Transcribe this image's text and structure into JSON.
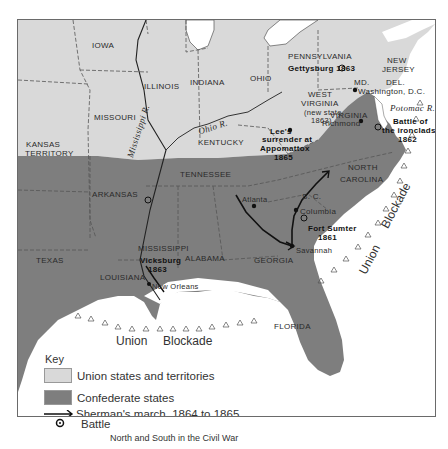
{
  "map": {
    "colors": {
      "union": "#d9d9d9",
      "confederate": "#7e7e7e",
      "water": "#ffffff",
      "border": "#555555",
      "route": "#111111"
    },
    "union_states": [
      "IOWA",
      "ILLINOIS",
      "INDIANA",
      "OHIO",
      "PENNSYLVANIA",
      "NEW JERSEY",
      "MISSOURI",
      "KANSAS TERRITORY",
      "KENTUCKY",
      "WEST VIRGINIA",
      "MD.",
      "DEL."
    ],
    "confederate_states": [
      "TEXAS",
      "ARKANSAS",
      "LOUISIANA",
      "MISSISSIPPI",
      "ALABAMA",
      "TENNESSEE",
      "GEORGIA",
      "FLORIDA",
      "VIRGINIA",
      "NORTH CAROLINA",
      "S. C."
    ],
    "labels": {
      "iowa": "IOWA",
      "illinois": "ILLINOIS",
      "indiana": "INDIANA",
      "ohio": "OHIO",
      "pennsylvania": "PENNSYLVANIA",
      "new_jersey_1": "NEW",
      "new_jersey_2": "JERSEY",
      "del": "DEL.",
      "md": "MD.",
      "missouri": "MISSOURI",
      "kansas_1": "KANSAS",
      "kansas_2": "TERRITORY",
      "kentucky": "KENTUCKY",
      "west_virginia_1": "WEST",
      "west_virginia_2": "VIRGINIA",
      "west_virginia_3": "(new state",
      "west_virginia_4": "1863)",
      "virginia": "VIRGINIA",
      "tennessee": "TENNESSEE",
      "arkansas": "ARKANSAS",
      "north_carolina_1": "NORTH",
      "north_carolina_2": "CAROLINA",
      "sc": "S. C.",
      "mississippi": "MISSISSIPPI",
      "alabama": "ALABAMA",
      "georgia": "GEORGIA",
      "texas": "TEXAS",
      "louisiana": "LOUISIANA",
      "florida": "FLORIDA"
    },
    "rivers": {
      "ohio": "Ohio R.",
      "mississippi": "Mississippi R.",
      "potomac": "Potomac R."
    },
    "cities": {
      "washington": "Washington, D.C.",
      "richmond": "Richmond",
      "atlanta": "Atlanta",
      "columbia": "Columbia",
      "savannah": "Savannah",
      "new_orleans": "New Orleans"
    },
    "battles": {
      "gettysburg": "Gettysburg 1863",
      "ironclads_1": "Battle of",
      "ironclads_2": "the ironclads",
      "ironclads_3": "1862",
      "fort_sumter_1": "Fort Sumter",
      "fort_sumter_2": "1861",
      "vicksburg_1": "Vicksburg",
      "vicksburg_2": "1863"
    },
    "events": {
      "appomattox_1": "Lee's",
      "appomattox_2": "surrender at",
      "appomattox_3": "Appomattox",
      "appomattox_4": "1865"
    },
    "blockade": {
      "gulf_word_1": "Union",
      "gulf_word_2": "Blockade",
      "atlantic_word_1": "Union",
      "atlantic_word_2": "Blockade"
    }
  },
  "legend": {
    "title": "Key",
    "items": [
      {
        "label": "Union states and territories",
        "symbol": "union-swatch"
      },
      {
        "label": "Confederate states",
        "symbol": "confederate-swatch"
      },
      {
        "label": "Sherman's march, 1864 to 1865",
        "symbol": "arrow"
      },
      {
        "label": "Battle",
        "symbol": "battle-icon"
      }
    ]
  },
  "caption": "North and South in the Civil War"
}
